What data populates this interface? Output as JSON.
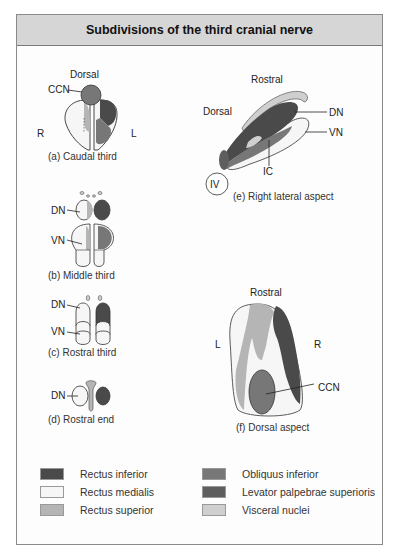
{
  "title": "Subdivisions of the third cranial nerve",
  "colors": {
    "rectus_inferior": "#4a4a4a",
    "rectus_medialis": "#f6f6f6",
    "rectus_superior": "#b5b5b5",
    "obliquus_inferior": "#777777",
    "levator_palpebrae_superioris": "#5e5e5e",
    "visceral_nuclei": "#cfcfcf"
  },
  "panels": {
    "a": {
      "caption": "(a) Caudal third",
      "labels": {
        "top": "Dorsal",
        "ccn": "CCN",
        "right_side": "R",
        "left_side": "L"
      }
    },
    "b": {
      "caption": "(b) Middle third",
      "labels": {
        "dn": "DN",
        "vn": "VN"
      }
    },
    "c": {
      "caption": "(c) Rostral third",
      "labels": {
        "dn": "DN",
        "vn": "VN"
      }
    },
    "d": {
      "caption": "(d) Rostral end",
      "labels": {
        "dn": "DN"
      }
    },
    "e": {
      "caption": "(e) Right lateral aspect",
      "labels": {
        "rostral": "Rostral",
        "dorsal": "Dorsal",
        "dn": "DN",
        "vn": "VN",
        "ic": "IC",
        "iv": "IV"
      }
    },
    "f": {
      "caption": "(f) Dorsal aspect",
      "labels": {
        "rostral": "Rostral",
        "left_side": "L",
        "right_side": "R",
        "ccn": "CCN"
      }
    }
  },
  "legend": [
    {
      "label": "Rectus inferior",
      "color": "#4a4a4a"
    },
    {
      "label": "Rectus medialis",
      "color": "#f6f6f6"
    },
    {
      "label": "Rectus superior",
      "color": "#b5b5b5"
    },
    {
      "label": "Obliquus inferior",
      "color": "#777777"
    },
    {
      "label": "Levator palpebrae superioris",
      "color": "#5e5e5e"
    },
    {
      "label": "Visceral nuclei",
      "color": "#cfcfcf"
    }
  ]
}
